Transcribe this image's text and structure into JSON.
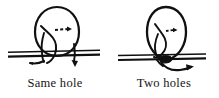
{
  "figure": {
    "type": "line-drawing-diagram",
    "background_color": "#ffffff",
    "ink_color": "#101010",
    "panels": [
      {
        "id": "left",
        "caption": "Same hole",
        "loop_label": "closed loop crossing band twice",
        "arrow_style": "dashed",
        "arrow_direction": "right",
        "band": {
          "x_start": 8,
          "x_end": 100,
          "y_top": 52,
          "y_bottom": 57
        },
        "loop": {
          "center_x": 57,
          "center_y": 33,
          "radius_x": 22,
          "radius_y": 26
        }
      },
      {
        "id": "right",
        "caption": "Two holes",
        "loop_label": "closed loop pinched at band",
        "arrow_style": "solid",
        "arrow_direction": "right",
        "band": {
          "x_start": 118,
          "x_end": 206,
          "y_top": 55,
          "y_bottom": 60
        },
        "loop": {
          "center_x": 166,
          "center_y": 33,
          "radius_x": 20,
          "radius_y": 26
        }
      }
    ]
  },
  "captions": {
    "left": "Same hole",
    "right": "Two holes"
  },
  "colors": {
    "ink": "#101010",
    "paper": "#ffffff"
  }
}
